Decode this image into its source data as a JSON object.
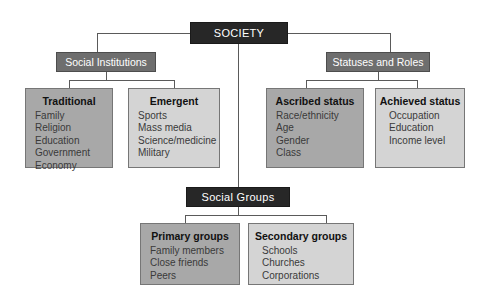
{
  "diagram": {
    "root": {
      "label": "SOCIETY"
    },
    "branches": [
      {
        "label": "Social Institutions",
        "children": [
          {
            "title": "Traditional",
            "items": [
              "Family",
              "Religion",
              "Education",
              "Government",
              "Economy"
            ]
          },
          {
            "title": "Emergent",
            "items": [
              "Sports",
              "Mass media",
              "Science/medicine",
              "Military"
            ]
          }
        ]
      },
      {
        "label": "Statuses and Roles",
        "children": [
          {
            "title": "Ascribed status",
            "items": [
              "Race/ethnicity",
              "Age",
              "Gender",
              "Class"
            ]
          },
          {
            "title": "Achieved status",
            "items": [
              "Occupation",
              "Education",
              "Income level"
            ]
          }
        ]
      },
      {
        "label": "Social Groups",
        "children": [
          {
            "title": "Primary groups",
            "items": [
              "Family members",
              "Close friends",
              "Peers"
            ]
          },
          {
            "title": "Secondary groups",
            "items": [
              "Schools",
              "Churches",
              "Corporations"
            ]
          }
        ]
      }
    ]
  },
  "colors": {
    "root_box": "#272727",
    "branch_box": "#6e6e6e",
    "leaf_mid": "#a8a8a8",
    "leaf_light": "#d4d4d4",
    "connector": "#5a5a5a",
    "background": "#ffffff"
  }
}
